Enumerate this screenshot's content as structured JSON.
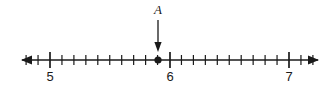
{
  "figure": {
    "kind": "number-line",
    "background_color": "#ffffff",
    "ink_color": "#1a1a1a"
  },
  "chart_data": {
    "type": "line",
    "title": "",
    "subtitle": "",
    "xlabel": "",
    "ylabel": "",
    "orientation": "horizontal",
    "grid": false,
    "legend": false,
    "axis": {
      "min_shown": 4.77,
      "max_shown": 7.24,
      "arrow_left": true,
      "arrow_right": true,
      "major_tick_interval": 1,
      "minor_tick_interval": 0.1,
      "minor_ticks_per_major": 10
    },
    "major_ticks": [
      {
        "value": 5,
        "label": "5",
        "x": 50
      },
      {
        "value": 6,
        "label": "6",
        "x": 170
      },
      {
        "value": 7,
        "label": "7",
        "x": 289
      }
    ],
    "tick_labels": [
      "5",
      "6",
      "7"
    ],
    "minor_tick_values": [
      4.8,
      4.9,
      5.1,
      5.2,
      5.3,
      5.4,
      5.5,
      5.6,
      5.7,
      5.8,
      5.9,
      6.1,
      6.2,
      6.3,
      6.4,
      6.5,
      6.6,
      6.7,
      6.8,
      6.9,
      7.1,
      7.2
    ],
    "points": [
      {
        "name": "A",
        "label": "A",
        "value": 5.9,
        "x": 158,
        "marker": "filled-circle",
        "annotated": true,
        "annotation_arrow": "down"
      }
    ],
    "annotations": [
      {
        "text": "A",
        "target_value": 5.9,
        "arrow_direction": "down",
        "arrow_from_y": 20,
        "arrow_to_y": 52
      }
    ]
  },
  "geometry": {
    "axis_y": 60,
    "axis_x_start": 22,
    "axis_x_end": 318,
    "major_tick_half_height": 8,
    "minor_tick_half_height": 5,
    "unit_pixels": 119.5,
    "label_baseline_y": 81,
    "point_label_baseline_y": 14,
    "point_radius": 3.6
  }
}
